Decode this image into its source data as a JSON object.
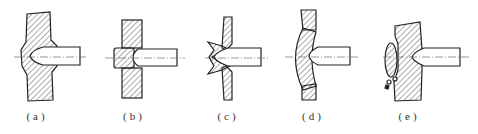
{
  "figure": {
    "type": "technical-section-drawing",
    "colors": {
      "line": "#222222",
      "hatch": "#444444",
      "background": "#ffffff"
    },
    "panels": [
      {
        "id": "a",
        "label": "(a)",
        "label_x": 37
      },
      {
        "id": "b",
        "label": "(b)",
        "label_x": 134
      },
      {
        "id": "c",
        "label": "(c)",
        "label_x": 228
      },
      {
        "id": "d",
        "label": "(d)",
        "label_x": 313
      },
      {
        "id": "e",
        "label": "(e)",
        "label_x": 409
      }
    ]
  }
}
